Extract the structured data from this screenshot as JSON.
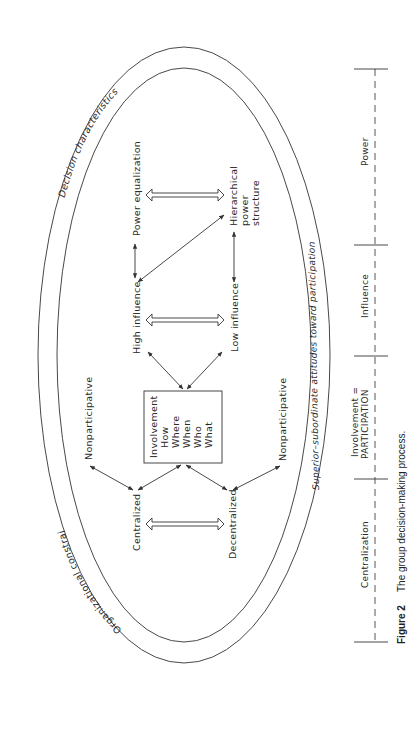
{
  "figure": {
    "caption_number": "Figure 2",
    "caption_text": "The group decision-making process.",
    "orientation": "rotated 90 degrees counter-clockwise"
  },
  "ellipse_labels": {
    "outer_top": "Decision characteristics",
    "outer_bottom_left": "Organizational constraints",
    "inner_right": "Superior–subordinate attitudes toward participation"
  },
  "nodes": {
    "power_equalization": "Power equalization",
    "hierarchical_power_structure": [
      "Hierarchical",
      "power",
      "structure"
    ],
    "high_influence": "High influence",
    "low_influence": "Low influence",
    "involvement_box": [
      "Involvement",
      "How",
      "Where",
      "When",
      "Who",
      "What"
    ],
    "nonparticipative_left": "Nonparticipative",
    "nonparticipative_right": "Nonparticipative",
    "centralized": "Centralized",
    "decentralized": "Decentralized"
  },
  "scale": {
    "segments": [
      {
        "label": "Power"
      },
      {
        "label": "Influence"
      },
      {
        "label_line1": "Involvement =",
        "label_line2": "PARTICIPATION"
      },
      {
        "label": "Centralization"
      }
    ]
  },
  "colors": {
    "line": "#333333",
    "text": "#2a2a2a",
    "background": "#ffffff"
  }
}
